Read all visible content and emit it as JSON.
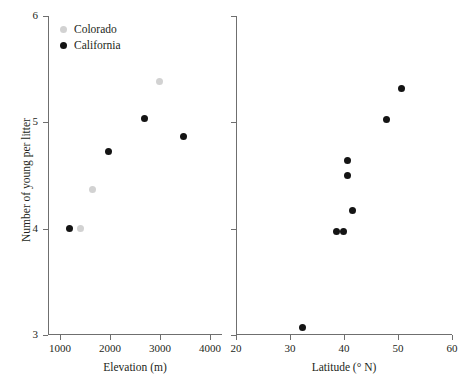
{
  "chart_data": [
    {
      "id": "elevation-panel",
      "type": "scatter",
      "title": "",
      "xlabel": "Elevation (m)",
      "ylabel": "Number of young per litter",
      "xlim": [
        750,
        4250
      ],
      "ylim": [
        3,
        6
      ],
      "xticks": [
        1000,
        2000,
        3000,
        4000
      ],
      "xticklabels": [
        "1000",
        "2000",
        "3000",
        "4000"
      ],
      "yticks": [
        3,
        4,
        5,
        6
      ],
      "yticklabels": [
        "3",
        "4",
        "5",
        "6"
      ],
      "grid": false,
      "legend_position": "top-left",
      "series": [
        {
          "name": "Colorado",
          "color": "#d2d2d2",
          "points": [
            {
              "x": 1400,
              "y": 4.0
            },
            {
              "x": 1650,
              "y": 4.37
            },
            {
              "x": 2990,
              "y": 5.38
            }
          ]
        },
        {
          "name": "California",
          "color": "#141414",
          "points": [
            {
              "x": 1190,
              "y": 4.0
            },
            {
              "x": 1960,
              "y": 4.73
            },
            {
              "x": 2690,
              "y": 5.04
            },
            {
              "x": 3480,
              "y": 4.87
            }
          ]
        }
      ]
    },
    {
      "id": "latitude-panel",
      "type": "scatter",
      "title": "",
      "xlabel": "Latitude (° N)",
      "ylabel": "Number of young per litter",
      "xlim": [
        20,
        60
      ],
      "ylim": [
        3,
        6
      ],
      "xticks": [
        20,
        30,
        40,
        50,
        60
      ],
      "xticklabels": [
        "20",
        "30",
        "40",
        "50",
        "60"
      ],
      "yticks": [
        3,
        4,
        5,
        6
      ],
      "yticklabels": [
        "",
        "",
        "",
        ""
      ],
      "grid": false,
      "legend_position": "none",
      "series": [
        {
          "name": "California",
          "color": "#141414",
          "points": [
            {
              "x": 32.3,
              "y": 3.07
            },
            {
              "x": 38.6,
              "y": 3.97
            },
            {
              "x": 39.9,
              "y": 3.97
            },
            {
              "x": 41.6,
              "y": 4.17
            },
            {
              "x": 40.6,
              "y": 4.5
            },
            {
              "x": 40.6,
              "y": 4.64
            },
            {
              "x": 47.9,
              "y": 5.03
            },
            {
              "x": 50.6,
              "y": 5.32
            }
          ]
        }
      ]
    }
  ],
  "legend": {
    "items": [
      {
        "label": "Colorado",
        "color": "#d2d2d2",
        "marker": "filled-circle-icon"
      },
      {
        "label": "California",
        "color": "#141414",
        "marker": "filled-circle-icon"
      }
    ]
  },
  "axis_titles": {
    "y": "Number of young per litter",
    "x_left": "Elevation (m)",
    "x_right": "Latitude (° N)"
  },
  "colors": {
    "axis": "#6f6f6f",
    "text": "#231f20",
    "california": "#141414",
    "colorado": "#d2d2d2",
    "background": "#ffffff"
  }
}
